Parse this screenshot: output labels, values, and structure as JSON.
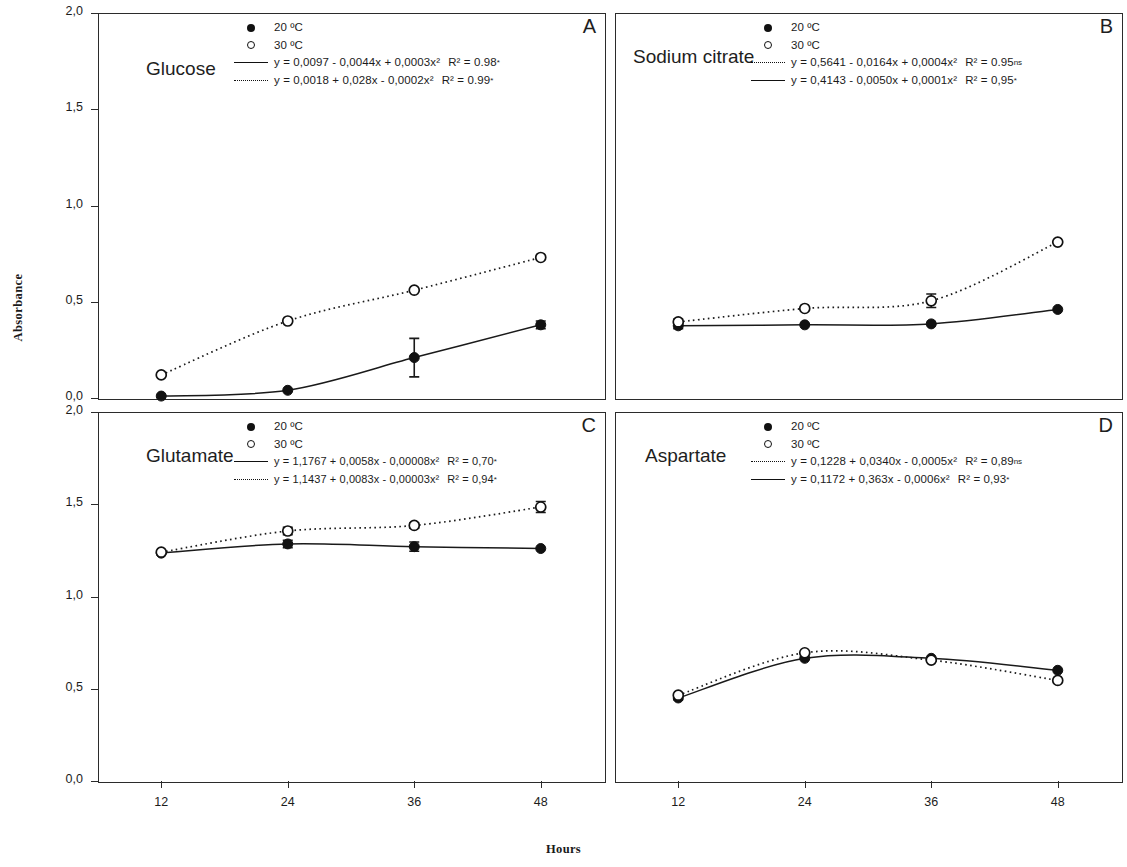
{
  "figure": {
    "ylabel": "Absorbance",
    "xlabel": "Hours",
    "y_ticks": [
      "2,0",
      "1,5",
      "1,0",
      "0,5",
      "0,0"
    ],
    "x_ticks": [
      "12",
      "24",
      "36",
      "48"
    ]
  },
  "legend_common": {
    "series20": "20 ºC",
    "series30": "30 ºC"
  },
  "panels": [
    {
      "letter": "A",
      "title": "Glucose",
      "eq_first": "y = 0,0097 - 0,0044x + 0,0003x²",
      "r2_first": "R² = 0.98",
      "sig_first": "*",
      "eq_second": "y = 0,0018 + 0,028x - 0,0002x²",
      "r2_second": "R² = 0.99",
      "sig_second": "*"
    },
    {
      "letter": "B",
      "title": "Sodium citrate",
      "eq_first": "y = 0,5641 - 0,0164x + 0,0004x²",
      "r2_first": "R² = 0.95",
      "sig_first": "ns",
      "eq_second": "y = 0,4143 - 0,0050x + 0,0001x²",
      "r2_second": "R² = 0,95",
      "sig_second": "*"
    },
    {
      "letter": "C",
      "title": "Glutamate",
      "eq_first": "y = 1,1767 + 0,0058x - 0,00008x²",
      "r2_first": "R² = 0,70",
      "sig_first": "*",
      "eq_second": "y = 1,1437 + 0,0083x - 0,00003x²",
      "r2_second": "R² = 0,94",
      "sig_second": "*"
    },
    {
      "letter": "D",
      "title": "Aspartate",
      "eq_first": "y = 0,1228 + 0,0340x - 0,0005x²",
      "r2_first": "R² = 0,89",
      "sig_first": "ns",
      "eq_second": "y = 0,1172 + 0,363x - 0,0006x²",
      "r2_second": "R² = 0,93",
      "sig_second": "*"
    }
  ],
  "chart_data": {
    "type": "scatter",
    "xlabel": "Hours",
    "ylabel": "Absorbance",
    "xlim": [
      6,
      54
    ],
    "ylim": [
      0.0,
      2.0
    ],
    "x_ticks": [
      12,
      24,
      36,
      48
    ],
    "y_ticks": [
      0.0,
      0.5,
      1.0,
      1.5,
      2.0
    ],
    "grid": false,
    "legend_position": "top-center",
    "panels": [
      {
        "letter": "A",
        "title": "Glucose",
        "x": [
          12,
          24,
          36,
          48
        ],
        "series": [
          {
            "name": "20 ºC",
            "marker": "filled-circle",
            "line": "solid",
            "values": [
              0.01,
              0.04,
              0.21,
              0.38
            ],
            "errors": [
              0.0,
              0.0,
              0.1,
              0.02
            ],
            "fit": "y = 0,0097 - 0,0044x + 0,0003x²",
            "r2": 0.98,
            "significance": "*"
          },
          {
            "name": "30 ºC",
            "marker": "open-circle",
            "line": "dotted",
            "values": [
              0.12,
              0.4,
              0.56,
              0.73
            ],
            "errors": [
              0.0,
              0.0,
              0.0,
              0.0
            ],
            "fit": "y = 0,0018 + 0,028x - 0,0002x²",
            "r2": 0.99,
            "significance": "*"
          }
        ]
      },
      {
        "letter": "B",
        "title": "Sodium citrate",
        "x": [
          12,
          24,
          36,
          48
        ],
        "series": [
          {
            "name": "20 ºC",
            "marker": "filled-circle",
            "line": "solid",
            "values": [
              0.375,
              0.38,
              0.385,
              0.46
            ],
            "errors": [
              0.015,
              0.0,
              0.0,
              0.0
            ],
            "fit": "y = 0,4143 - 0,0050x + 0,0001x²",
            "r2": 0.95,
            "significance": "*"
          },
          {
            "name": "30 ºC",
            "marker": "open-circle",
            "line": "dotted",
            "values": [
              0.395,
              0.465,
              0.505,
              0.81
            ],
            "errors": [
              0.015,
              0.0,
              0.035,
              0.0
            ],
            "fit": "y = 0,5641 - 0,0164x + 0,0004x²",
            "r2": 0.95,
            "significance": "ns"
          }
        ]
      },
      {
        "letter": "C",
        "title": "Glutamate",
        "x": [
          12,
          24,
          36,
          48
        ],
        "series": [
          {
            "name": "20 ºC",
            "marker": "filled-circle",
            "line": "solid",
            "values": [
              1.235,
              1.285,
              1.27,
              1.26
            ],
            "errors": [
              0.0,
              0.02,
              0.025,
              0.0
            ],
            "fit": "y = 1,1767 + 0,0058x - 0,00008x²",
            "r2": 0.7,
            "significance": "*"
          },
          {
            "name": "30 ºC",
            "marker": "open-circle",
            "line": "dotted",
            "values": [
              1.24,
              1.355,
              1.385,
              1.485
            ],
            "errors": [
              0.0,
              0.02,
              0.015,
              0.03
            ],
            "fit": "y = 1,1437 + 0,0083x - 0,00003x²",
            "r2": 0.94,
            "significance": "*"
          }
        ]
      },
      {
        "letter": "D",
        "title": "Aspartate",
        "x": [
          12,
          24,
          36,
          48
        ],
        "series": [
          {
            "name": "20 ºC",
            "marker": "filled-circle",
            "line": "solid",
            "values": [
              0.45,
              0.665,
              0.665,
              0.6
            ],
            "errors": [
              0.01,
              0.0,
              0.0,
              0.0
            ],
            "fit": "y = 0,1172 + 0,363x - 0,0006x²",
            "r2": 0.93,
            "significance": "*"
          },
          {
            "name": "30 ºC",
            "marker": "open-circle",
            "line": "dotted",
            "values": [
              0.465,
              0.695,
              0.655,
              0.545
            ],
            "errors": [
              0.0,
              0.0,
              0.0,
              0.0
            ],
            "fit": "y = 0,1228 + 0,0340x - 0,0005x²",
            "r2": 0.89,
            "significance": "ns"
          }
        ]
      }
    ]
  }
}
